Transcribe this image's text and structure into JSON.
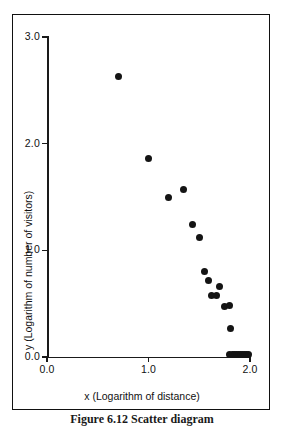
{
  "figure": {
    "caption": "Figure 6.12  Scatter diagram"
  },
  "chart_data": {
    "type": "scatter",
    "title": "",
    "xlabel": "x (Logarithm of distance)",
    "ylabel": "y (Logarithm of number of visitors)",
    "xlim": [
      0.0,
      2.0
    ],
    "ylim": [
      0.0,
      3.0
    ],
    "grid": false,
    "legend": null,
    "xticks": [
      "0.0",
      "1.0",
      "2.0"
    ],
    "xtickvalues": [
      0.0,
      1.0,
      2.0
    ],
    "yticks": [
      "0.0",
      "1.0",
      "2.0",
      "3.0"
    ],
    "ytickvalues": [
      0.0,
      1.0,
      2.0,
      3.0
    ],
    "marker": "filled-circle",
    "marker_color": "#141414",
    "points": [
      {
        "x": 0.7,
        "y": 2.63
      },
      {
        "x": 1.0,
        "y": 1.86
      },
      {
        "x": 1.2,
        "y": 1.5
      },
      {
        "x": 1.34,
        "y": 1.57
      },
      {
        "x": 1.43,
        "y": 1.24
      },
      {
        "x": 1.5,
        "y": 1.12
      },
      {
        "x": 1.55,
        "y": 0.8
      },
      {
        "x": 1.59,
        "y": 0.72
      },
      {
        "x": 1.62,
        "y": 0.58
      },
      {
        "x": 1.67,
        "y": 0.58
      },
      {
        "x": 1.7,
        "y": 0.66
      },
      {
        "x": 1.75,
        "y": 0.47
      },
      {
        "x": 1.8,
        "y": 0.48
      },
      {
        "x": 1.81,
        "y": 0.27
      },
      {
        "x": 1.8,
        "y": 0.02
      },
      {
        "x": 1.83,
        "y": 0.02
      },
      {
        "x": 1.85,
        "y": 0.02
      },
      {
        "x": 1.87,
        "y": 0.02
      },
      {
        "x": 1.89,
        "y": 0.02
      },
      {
        "x": 1.91,
        "y": 0.02
      },
      {
        "x": 1.93,
        "y": 0.02
      },
      {
        "x": 1.95,
        "y": 0.02
      },
      {
        "x": 1.97,
        "y": 0.02
      },
      {
        "x": 1.99,
        "y": 0.02
      }
    ]
  }
}
